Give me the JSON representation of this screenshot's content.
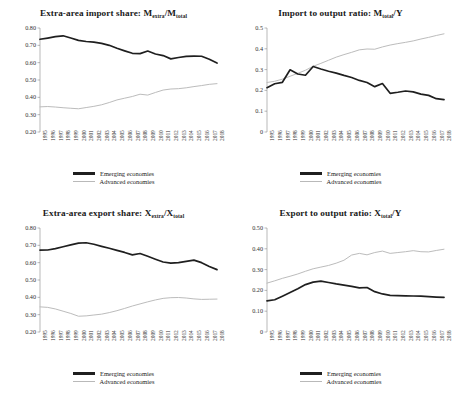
{
  "figure": {
    "years": [
      1995,
      1996,
      1997,
      1998,
      1999,
      2000,
      2001,
      2002,
      2003,
      2004,
      2005,
      2006,
      2007,
      2008,
      2009,
      2010,
      2011,
      2012,
      2013,
      2014,
      2015,
      2016,
      2017,
      2018
    ],
    "legend": {
      "emerging_label": "Emerging economies",
      "advanced_label": "Advanced economies",
      "emerging_color": "#1f1f1f",
      "advanced_color": "#bcbcbc"
    }
  },
  "chart_data": [
    {
      "type": "line",
      "id": "extra-area-import-share",
      "title_main": "Extra-area import share: M",
      "title_sub1": "extra",
      "title_mid": "/M",
      "title_sub2": "total",
      "title": "Extra-area import share: Mextra/Mtotal",
      "xlabel": "",
      "ylabel": "",
      "ylim": [
        0.2,
        0.8
      ],
      "yticks": [
        0.8,
        0.7,
        0.6,
        0.5,
        0.4,
        0.3,
        0.2
      ],
      "ytick_labels": [
        "0.80",
        "0.70",
        "0.60",
        "0.50",
        "0.40",
        "0.30",
        "0.20"
      ],
      "grid": false,
      "legend_position": "below",
      "x": [
        1995,
        1996,
        1997,
        1998,
        1999,
        2000,
        2001,
        2002,
        2003,
        2004,
        2005,
        2006,
        2007,
        2008,
        2009,
        2010,
        2011,
        2012,
        2013,
        2014,
        2015,
        2016,
        2017,
        2018
      ],
      "series": [
        {
          "name": "Emerging economies",
          "values": [
            0.735,
            0.742,
            0.75,
            0.755,
            0.742,
            0.729,
            0.722,
            0.718,
            0.711,
            0.7,
            0.683,
            0.668,
            0.654,
            0.652,
            0.667,
            0.65,
            0.641,
            0.622,
            0.63,
            0.636,
            0.638,
            0.637,
            0.62,
            0.598
          ]
        },
        {
          "name": "Advanced economies",
          "values": [
            0.345,
            0.347,
            0.344,
            0.34,
            0.337,
            0.334,
            0.341,
            0.348,
            0.357,
            0.37,
            0.385,
            0.395,
            0.405,
            0.418,
            0.413,
            0.428,
            0.442,
            0.448,
            0.45,
            0.455,
            0.462,
            0.468,
            0.475,
            0.479
          ]
        }
      ]
    },
    {
      "type": "line",
      "id": "import-to-output-ratio",
      "title_main": "Import to output ratio: M",
      "title_sub1": "total",
      "title_mid": "/Y",
      "title_sub2": "",
      "title": "Import to output ratio: Mtotal/Y",
      "xlabel": "",
      "ylabel": "",
      "ylim": [
        0,
        0.5
      ],
      "yticks": [
        0.5,
        0.4,
        0.3,
        0.2,
        0.1,
        0
      ],
      "ytick_labels": [
        "0.5",
        "0.4",
        "0.3",
        "0.2",
        "0.1",
        "0"
      ],
      "grid": false,
      "legend_position": "below",
      "x": [
        1995,
        1996,
        1997,
        1998,
        1999,
        2000,
        2001,
        2002,
        2003,
        2004,
        2005,
        2006,
        2007,
        2008,
        2009,
        2010,
        2011,
        2012,
        2013,
        2014,
        2015,
        2016,
        2017,
        2018
      ],
      "series": [
        {
          "name": "Emerging economies",
          "values": [
            0.213,
            0.232,
            0.239,
            0.299,
            0.279,
            0.273,
            0.315,
            0.303,
            0.292,
            0.283,
            0.272,
            0.262,
            0.248,
            0.238,
            0.218,
            0.233,
            0.186,
            0.191,
            0.197,
            0.193,
            0.182,
            0.176,
            0.16,
            0.156
          ]
        },
        {
          "name": "Advanced economies",
          "values": [
            0.238,
            0.244,
            0.254,
            0.268,
            0.282,
            0.297,
            0.316,
            0.33,
            0.345,
            0.36,
            0.372,
            0.383,
            0.395,
            0.399,
            0.398,
            0.409,
            0.418,
            0.425,
            0.431,
            0.438,
            0.447,
            0.455,
            0.464,
            0.472
          ]
        }
      ]
    },
    {
      "type": "line",
      "id": "extra-area-export-share",
      "title_main": "Extra-area export share: X",
      "title_sub1": "extra",
      "title_mid": "/X",
      "title_sub2": "total",
      "title": "Extra-area export share: Xextra/Xtotal",
      "xlabel": "",
      "ylabel": "",
      "ylim": [
        0.2,
        0.8
      ],
      "yticks": [
        0.8,
        0.7,
        0.6,
        0.5,
        0.4,
        0.3,
        0.2
      ],
      "ytick_labels": [
        "0.80",
        "0.70",
        "0.60",
        "0.50",
        "0.40",
        "0.30",
        "0.20"
      ],
      "grid": false,
      "legend_position": "below",
      "x": [
        1995,
        1996,
        1997,
        1998,
        1999,
        2000,
        2001,
        2002,
        2003,
        2004,
        2005,
        2006,
        2007,
        2008,
        2009,
        2010,
        2011,
        2012,
        2013,
        2014,
        2015,
        2016,
        2017,
        2018
      ],
      "series": [
        {
          "name": "Emerging economies",
          "values": [
            0.672,
            0.673,
            0.681,
            0.692,
            0.703,
            0.713,
            0.715,
            0.706,
            0.694,
            0.683,
            0.671,
            0.659,
            0.645,
            0.653,
            0.637,
            0.62,
            0.604,
            0.597,
            0.6,
            0.607,
            0.615,
            0.6,
            0.578,
            0.56
          ]
        },
        {
          "name": "Advanced economies",
          "values": [
            0.345,
            0.342,
            0.333,
            0.32,
            0.307,
            0.291,
            0.293,
            0.298,
            0.303,
            0.312,
            0.323,
            0.336,
            0.35,
            0.362,
            0.374,
            0.385,
            0.394,
            0.398,
            0.399,
            0.396,
            0.391,
            0.388,
            0.389,
            0.39
          ]
        }
      ]
    },
    {
      "type": "line",
      "id": "export-to-output-ratio",
      "title_main": "Export to output ratio: X",
      "title_sub1": "total",
      "title_mid": "/Y",
      "title_sub2": "",
      "title": "Export to output ratio: Xtotal/Y",
      "xlabel": "",
      "ylabel": "",
      "ylim": [
        0,
        0.5
      ],
      "yticks": [
        0.5,
        0.4,
        0.3,
        0.2,
        0.1,
        0
      ],
      "ytick_labels": [
        "0.50",
        "0.40",
        "0.30",
        "0.20",
        "0.10",
        "0"
      ],
      "grid": false,
      "legend_position": "below",
      "x": [
        1995,
        1996,
        1997,
        1998,
        1999,
        2000,
        2001,
        2002,
        2003,
        2004,
        2005,
        2006,
        2007,
        2008,
        2009,
        2010,
        2011,
        2012,
        2013,
        2014,
        2015,
        2016,
        2017,
        2018
      ],
      "series": [
        {
          "name": "Emerging economies",
          "values": [
            0.15,
            0.155,
            0.172,
            0.19,
            0.208,
            0.228,
            0.24,
            0.245,
            0.238,
            0.231,
            0.225,
            0.219,
            0.212,
            0.214,
            0.194,
            0.183,
            0.176,
            0.175,
            0.174,
            0.173,
            0.172,
            0.17,
            0.168,
            0.166
          ]
        },
        {
          "name": "Advanced economies",
          "values": [
            0.235,
            0.246,
            0.258,
            0.268,
            0.279,
            0.292,
            0.304,
            0.312,
            0.32,
            0.331,
            0.345,
            0.37,
            0.378,
            0.371,
            0.382,
            0.389,
            0.378,
            0.382,
            0.386,
            0.391,
            0.386,
            0.385,
            0.392,
            0.398
          ]
        }
      ]
    }
  ]
}
